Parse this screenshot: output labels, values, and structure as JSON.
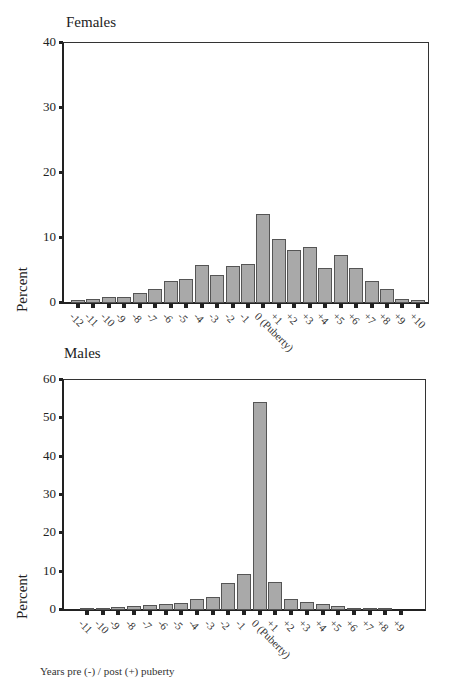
{
  "chart_data": [
    {
      "type": "bar",
      "title": "Females",
      "xlabel": "Years pre (-) / post (+) puberty",
      "ylabel": "Percent",
      "ylim": [
        0,
        40
      ],
      "yticks": [
        0,
        10,
        20,
        30,
        40
      ],
      "grid": false,
      "categories": [
        "-12",
        "-11",
        "-10",
        "-9",
        "-8",
        "-7",
        "-6",
        "-5",
        "-4",
        "-3",
        "-2",
        "-1",
        "0 (Puberty)",
        "+1",
        "+2",
        "+3",
        "+4",
        "+5",
        "+6",
        "+7",
        "+8",
        "+9",
        "+10"
      ],
      "values": [
        0.3,
        0.4,
        0.7,
        0.8,
        1.4,
        2.0,
        3.2,
        3.5,
        5.7,
        4.2,
        5.6,
        5.8,
        13.5,
        9.7,
        8.0,
        8.4,
        5.3,
        7.3,
        5.2,
        3.3,
        2.0,
        0.5,
        0.3
      ]
    },
    {
      "type": "bar",
      "title": "Males",
      "xlabel": "Years pre (-) / post (+) puberty",
      "ylabel": "Percent",
      "ylim": [
        0,
        60
      ],
      "yticks": [
        0,
        10,
        20,
        30,
        40,
        50,
        60
      ],
      "grid": false,
      "categories": [
        "-11",
        "-10",
        "-9",
        "-8",
        "-7",
        "-6",
        "-5",
        "-4",
        "-3",
        "-2",
        "-1",
        "0 (Puberty)",
        "+1",
        "+2",
        "+3",
        "+4",
        "+5",
        "+6",
        "+7",
        "+8",
        "+9"
      ],
      "values": [
        0.1,
        0.3,
        0.5,
        0.7,
        1.0,
        1.3,
        1.5,
        2.5,
        3.2,
        6.8,
        9.1,
        54.0,
        7.0,
        2.5,
        1.9,
        1.2,
        0.9,
        0.3,
        0.1,
        0.1,
        0.0
      ]
    }
  ],
  "footnote": "Years pre (-) / post (+) puberty",
  "colors": {
    "bar_fill": "#a9a9a9",
    "bar_edge": "#555555",
    "axis": "#222222"
  }
}
